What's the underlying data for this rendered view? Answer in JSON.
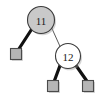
{
  "figure": {
    "name": "red-black-tree-fragment",
    "width": 102,
    "height": 98,
    "background_color": "#ffffff"
  },
  "style": {
    "internal_stroke": "#3b3b3b",
    "internal_stroke_width": 1.1,
    "black_node_fill": "#c9c9c9",
    "red_node_fill": "#ffffff",
    "label_color": "#1a1a1a",
    "label_font_size": 11,
    "nil_fill": "#b5b5b5",
    "nil_stroke": "#4a4a4a",
    "nil_stroke_width": 1.1,
    "thick_edge_color": "#111111",
    "thick_edge_width": 3.2,
    "thin_edge_color": "#5a5a5a",
    "thin_edge_width": 1.0,
    "shadow_color": "#9a9a9a"
  },
  "nodes": [
    {
      "id": "n11",
      "label": "11",
      "kind": "internal",
      "color": "black",
      "cx": 41,
      "cy": 20,
      "r": 13.5
    },
    {
      "id": "n12",
      "label": "12",
      "kind": "internal",
      "color": "red",
      "cx": 68,
      "cy": 56,
      "r": 12.5
    }
  ],
  "leaves": [
    {
      "id": "nil1",
      "label": "",
      "kind": "nil",
      "parent": "n11",
      "side": "left",
      "cx": 16,
      "cy": 54,
      "size": 11
    },
    {
      "id": "nil2",
      "label": "",
      "kind": "nil",
      "parent": "n12",
      "side": "left",
      "cx": 53,
      "cy": 86,
      "size": 11
    },
    {
      "id": "nil3",
      "label": "",
      "kind": "nil",
      "parent": "n12",
      "side": "right",
      "cx": 88,
      "cy": 86,
      "size": 11
    }
  ],
  "edges": [
    {
      "id": "e-n11-nil1",
      "from": "n11",
      "to": "nil1",
      "weight": "thick",
      "x1": 31.5,
      "y1": 29.5,
      "x2": 18.5,
      "y2": 49.5
    },
    {
      "id": "e-n11-n12",
      "from": "n11",
      "to": "n12",
      "weight": "thin",
      "x1": 51.5,
      "y1": 27.5,
      "x2": 60.5,
      "y2": 47.5
    },
    {
      "id": "e-n12-nil2",
      "from": "n12",
      "to": "nil2",
      "weight": "thick",
      "x1": 60.0,
      "y1": 65.5,
      "x2": 54.5,
      "y2": 80.5
    },
    {
      "id": "e-n12-nil3",
      "from": "n12",
      "to": "nil3",
      "weight": "thick",
      "x1": 76.0,
      "y1": 65.5,
      "x2": 86.5,
      "y2": 80.5
    }
  ]
}
